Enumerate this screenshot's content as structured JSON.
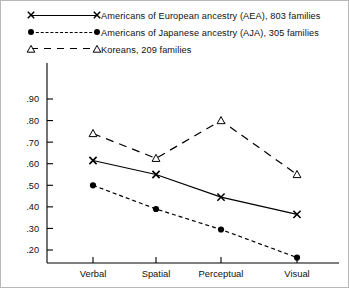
{
  "legend": {
    "position": "top-left",
    "entries": [
      {
        "marker": "x-marker",
        "line": "solid",
        "label": "Americans of European ancestry (AEA), 803 families"
      },
      {
        "marker": "filled-circle-marker",
        "line": "dashed-short",
        "label": "Americans of Japanese ancestry (AJA), 305 families"
      },
      {
        "marker": "open-triangle-marker",
        "line": "dashed-long",
        "label": "Koreans, 209 families"
      }
    ]
  },
  "chart_data": {
    "type": "line",
    "title": "",
    "xlabel": "",
    "ylabel": "",
    "categories": [
      "Verbal",
      "Spatial",
      "Perceptual",
      "Visual"
    ],
    "ylim": [
      0.15,
      0.95
    ],
    "yticks": [
      0.2,
      0.3,
      0.4,
      0.5,
      0.6,
      0.7,
      0.8,
      0.9
    ],
    "ytick_labels": [
      ".20",
      ".30",
      ".40",
      ".50",
      ".60",
      ".70",
      ".80",
      ".90"
    ],
    "grid": false,
    "legend_position": "above-plot",
    "series": [
      {
        "name": "Americans of European ancestry (AEA), 803 families",
        "marker": "x-marker",
        "line": "solid",
        "values": [
          0.615,
          0.55,
          0.445,
          0.365
        ]
      },
      {
        "name": "Americans of Japanese ancestry (AJA), 305 families",
        "marker": "filled-circle-marker",
        "line": "dashed-short",
        "values": [
          0.5,
          0.39,
          0.295,
          0.165
        ]
      },
      {
        "name": "Koreans, 209 families",
        "marker": "open-triangle-marker",
        "line": "dashed-long",
        "values": [
          0.74,
          0.625,
          0.8,
          0.55
        ]
      }
    ]
  },
  "colors": {
    "ink": "#000000",
    "background": "#ffffff",
    "frame": "#b8b8b8"
  }
}
